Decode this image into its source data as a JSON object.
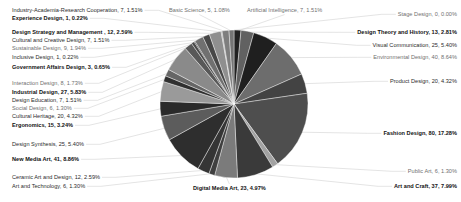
{
  "chart_data": {
    "type": "pie",
    "title": "",
    "subtitle": "",
    "xlabel": "",
    "ylabel": "",
    "legend_position": "callout-labels",
    "grid": false,
    "label_format": "{name}, {value}, {percent}",
    "total_value": 463,
    "start_angle_deg": -90,
    "direction": "clockwise",
    "center": {
      "x": 234,
      "y": 104
    },
    "radius": 74,
    "categories": [
      "Fashion Design",
      "New Media Art",
      "Environmental Design",
      "Art and Craft",
      "Industrial Design",
      "Visual Communication",
      "Design Synthesis",
      "Digital Media Art",
      "Product Design",
      "Cultural Heritage",
      "Ergonomics",
      "Design Theory and History",
      "Design Strategy and Management",
      "Ceramic Art and Design",
      "Interaction Design",
      "Design Education",
      "Artificial Intelligence",
      "Industry-Academia-Research Cooperation",
      "Cultural and Creative Design",
      "Sustainable Design",
      "Social Design",
      "Public Art",
      "Art and Technology",
      "Basic Science",
      "Government Affairs Design",
      "Experience Design",
      "Inclusive Design",
      "Stage Design"
    ],
    "values": [
      80,
      41,
      40,
      37,
      27,
      25,
      25,
      23,
      20,
      20,
      15,
      13,
      12,
      12,
      8,
      7,
      7,
      7,
      7,
      9,
      6,
      6,
      6,
      5,
      3,
      1,
      1,
      0
    ],
    "percentages": [
      "17.28%",
      "8.86%",
      "8.64%",
      "7.99%",
      "5.83%",
      "5.40%",
      "5.40%",
      "4.97%",
      "4.32%",
      "4.32%",
      "3.24%",
      "2.81%",
      "2.59%",
      "2.59%",
      "1.73%",
      "1.51%",
      "1.51%",
      "1.51%",
      "1.51%",
      "1.94%",
      "1.30%",
      "1.30%",
      "1.30%",
      "1.08%",
      "0.65%",
      "0.22%",
      "0.22%",
      "0.00%"
    ],
    "palette": [
      "#4e4e4e",
      "#2e2e2e",
      "#6d6d6d",
      "#3a3a3a",
      "#8a8a8a",
      "#1f1f1f",
      "#5c5c5c",
      "#7b7b7b",
      "#434343",
      "#9a9a9a",
      "#2a2a2a",
      "#616161",
      "#8f8f8f",
      "#353535",
      "#707070",
      "#585858",
      "#212121",
      "#7e7e7e",
      "#474747",
      "#666666",
      "#303030",
      "#a2a2a2",
      "#3f3f3f",
      "#757575",
      "#4a4a4a",
      "#969696",
      "#262626",
      "#888888"
    ]
  },
  "slices": [
    {
      "name": "Fashion Design",
      "value": 80,
      "percent": "17.28%",
      "sweep": 62.2,
      "color": "#4e4e4e"
    },
    {
      "name": "New Media Art",
      "value": 41,
      "percent": "8.86%",
      "sweep": 31.88,
      "color": "#2e2e2e"
    },
    {
      "name": "Environmental Design",
      "value": 40,
      "percent": "8.64%",
      "sweep": 31.1,
      "color": "#6d6d6d"
    },
    {
      "name": "Art and Craft",
      "value": 37,
      "percent": "7.99%",
      "sweep": 28.77,
      "color": "#3a3a3a"
    },
    {
      "name": "Industrial Design",
      "value": 27,
      "percent": "5.83%",
      "sweep": 20.99,
      "color": "#8a8a8a"
    },
    {
      "name": "Visual Communication",
      "value": 25,
      "percent": "5.40%",
      "sweep": 19.44,
      "color": "#1f1f1f"
    },
    {
      "name": "Design Synthesis",
      "value": 25,
      "percent": "5.40%",
      "sweep": 19.44,
      "color": "#5c5c5c"
    },
    {
      "name": "Digital Media Art",
      "value": 23,
      "percent": "4.97%",
      "sweep": 17.88,
      "color": "#7b7b7b"
    },
    {
      "name": "Product Design",
      "value": 20,
      "percent": "4.32%",
      "sweep": 15.55,
      "color": "#434343"
    },
    {
      "name": "Cultural Heritage",
      "value": 20,
      "percent": "4.32%",
      "sweep": 15.55,
      "color": "#9a9a9a"
    },
    {
      "name": "Ergonomics",
      "value": 15,
      "percent": "3.24%",
      "sweep": 11.66,
      "color": "#2a2a2a"
    },
    {
      "name": "Design Theory and History",
      "value": 13,
      "percent": "2.81%",
      "sweep": 10.11,
      "color": "#616161"
    },
    {
      "name": "Design Strategy and Management",
      "value": 12,
      "percent": "2.59%",
      "sweep": 9.33,
      "color": "#8f8f8f"
    },
    {
      "name": "Ceramic Art and Design",
      "value": 12,
      "percent": "2.59%",
      "sweep": 9.33,
      "color": "#353535"
    },
    {
      "name": "Sustainable Design",
      "value": 9,
      "percent": "1.94%",
      "sweep": 7.0,
      "color": "#707070"
    },
    {
      "name": "Interaction Design",
      "value": 8,
      "percent": "1.73%",
      "sweep": 6.22,
      "color": "#585858"
    },
    {
      "name": "Artificial Intelligence",
      "value": 7,
      "percent": "1.51%",
      "sweep": 5.44,
      "color": "#212121"
    },
    {
      "name": "Industry-Academia-Research Cooperation",
      "value": 7,
      "percent": "1.51%",
      "sweep": 5.44,
      "color": "#7e7e7e"
    },
    {
      "name": "Cultural and Creative Design",
      "value": 7,
      "percent": "1.51%",
      "sweep": 5.44,
      "color": "#474747"
    },
    {
      "name": "Design Education",
      "value": 7,
      "percent": "1.51%",
      "sweep": 5.44,
      "color": "#666666"
    },
    {
      "name": "Social Design",
      "value": 6,
      "percent": "1.30%",
      "sweep": 4.67,
      "color": "#303030"
    },
    {
      "name": "Public Art",
      "value": 6,
      "percent": "1.30%",
      "sweep": 4.67,
      "color": "#a2a2a2"
    },
    {
      "name": "Art and Technology",
      "value": 6,
      "percent": "1.30%",
      "sweep": 4.67,
      "color": "#3f3f3f"
    },
    {
      "name": "Basic Science",
      "value": 5,
      "percent": "1.08%",
      "sweep": 3.89,
      "color": "#757575"
    },
    {
      "name": "Government Affairs Design",
      "value": 3,
      "percent": "0.65%",
      "sweep": 2.33,
      "color": "#4a4a4a"
    },
    {
      "name": "Experience Design",
      "value": 1,
      "percent": "0.22%",
      "sweep": 0.78,
      "color": "#969696"
    },
    {
      "name": "Inclusive Design",
      "value": 1,
      "percent": "0.22%",
      "sweep": 0.78,
      "color": "#262626"
    },
    {
      "name": "Stage Design",
      "value": 0,
      "percent": "0.00%",
      "sweep": 0.0,
      "color": "#888888"
    }
  ],
  "labels": {
    "left": [
      {
        "text": "Industry-Academia-Research Cooperation, 7, 1.51%",
        "bold": false,
        "dim": false,
        "x": 12,
        "y": 7
      },
      {
        "text": "Experience Design, 1, 0.22%",
        "bold": true,
        "dim": false,
        "x": 12,
        "y": 15
      },
      {
        "text": "Design Strategy and Management , 12, 2.59%",
        "bold": true,
        "dim": false,
        "x": 12,
        "y": 29
      },
      {
        "text": "Cultural and Creative Design, 7, 1.51%",
        "bold": false,
        "dim": false,
        "x": 12,
        "y": 37
      },
      {
        "text": "Sustainable Design, 9, 1.94%",
        "bold": false,
        "dim": true,
        "x": 12,
        "y": 45
      },
      {
        "text": "Inclusive Design, 1, 0.22%",
        "bold": false,
        "dim": false,
        "x": 12,
        "y": 54
      },
      {
        "text": "Government Affairs Design, 3, 0.65%",
        "bold": true,
        "dim": false,
        "x": 12,
        "y": 64
      },
      {
        "text": "Interaction Design, 8, 1.73%",
        "bold": false,
        "dim": true,
        "x": 12,
        "y": 80
      },
      {
        "text": "Industrial Design, 27, 5.83%",
        "bold": true,
        "dim": false,
        "x": 12,
        "y": 89
      },
      {
        "text": "Design Education, 7, 1.51%",
        "bold": false,
        "dim": false,
        "x": 12,
        "y": 97
      },
      {
        "text": "Social Design, 6, 1.30%",
        "bold": false,
        "dim": true,
        "x": 12,
        "y": 105
      },
      {
        "text": "Cultural Heritage, 20, 4.32%",
        "bold": false,
        "dim": false,
        "x": 12,
        "y": 113
      },
      {
        "text": "Ergonomics, 15, 3.24%",
        "bold": true,
        "dim": false,
        "x": 12,
        "y": 122
      },
      {
        "text": "Design Synthesis, 25, 5.40%",
        "bold": false,
        "dim": false,
        "x": 12,
        "y": 141
      },
      {
        "text": "New Media Art, 41, 8.86%",
        "bold": true,
        "dim": false,
        "x": 12,
        "y": 156
      },
      {
        "text": "Ceramic Art and Design, 12, 2.59%",
        "bold": false,
        "dim": false,
        "x": 12,
        "y": 174
      },
      {
        "text": "Art and Technology, 6, 1.30%",
        "bold": false,
        "dim": false,
        "x": 12,
        "y": 183
      }
    ],
    "top": [
      {
        "text": "Basic Science, 5, 1.08%",
        "bold": false,
        "dim": true,
        "x": 169,
        "y": 7
      },
      {
        "text": "Artificial Intelligence, 7, 1.51%",
        "bold": false,
        "dim": true,
        "x": 247,
        "y": 7
      }
    ],
    "right": [
      {
        "text": "Stage Design, 0, 0.00%",
        "bold": false,
        "dim": true,
        "right": 4,
        "y": 11
      },
      {
        "text": "Design Theory and History, 13, 2.81%",
        "bold": true,
        "dim": false,
        "right": 4,
        "y": 29
      },
      {
        "text": "Visual Communication, 25, 5.40%",
        "bold": false,
        "dim": false,
        "right": 4,
        "y": 42
      },
      {
        "text": "Environmental Design, 40, 8.64%",
        "bold": false,
        "dim": true,
        "right": 4,
        "y": 54
      },
      {
        "text": "Product Design, 20, 4.32%",
        "bold": false,
        "dim": false,
        "right": 4,
        "y": 78
      },
      {
        "text": "Fashion Design, 80, 17.28%",
        "bold": true,
        "dim": false,
        "right": 4,
        "y": 130
      },
      {
        "text": "Public Art, 6, 1.30%",
        "bold": false,
        "dim": true,
        "right": 4,
        "y": 168
      },
      {
        "text": "Art and Craft, 37, 7.99%",
        "bold": true,
        "dim": false,
        "right": 4,
        "y": 183
      }
    ],
    "bottom": [
      {
        "text": "Digital Media Art, 23, 4.97%",
        "bold": true,
        "dim": false,
        "x": 193,
        "y": 185
      }
    ]
  },
  "leader_lines": {
    "color": "#c9c9c9",
    "width": 0.5
  }
}
